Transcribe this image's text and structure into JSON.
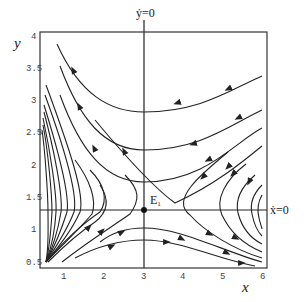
{
  "figure": {
    "type": "phase-portrait",
    "x_label": "x",
    "y_label": "y",
    "x_ticks": [
      "1",
      "2",
      "3",
      "4",
      "5",
      "6"
    ],
    "y_ticks": [
      "0.5",
      "1",
      "1.5",
      "2",
      "2.5",
      "3",
      "3.5",
      "4"
    ],
    "x_range": [
      0.5,
      6
    ],
    "y_range": [
      0.5,
      4
    ],
    "nullclines": {
      "y_dot_label": "ẏ=0",
      "x_dot_label": "ẋ=0",
      "y_dot_zero_at_x": 3,
      "x_dot_zero_at_y": 1.3
    },
    "equilibrium": {
      "label": "E",
      "subscript": "1",
      "x": 3,
      "y": 1.3
    },
    "colors": {
      "line": "#222222",
      "axis": "#333333",
      "background": "#ffffff"
    }
  }
}
